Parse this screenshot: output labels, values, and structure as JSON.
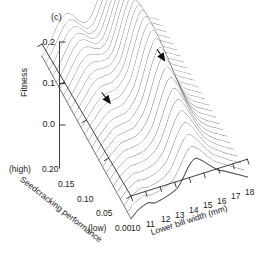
{
  "panel": {
    "label": "(c)"
  },
  "axes": {
    "vertical": {
      "title": "Fitness",
      "ticks": [
        "0.2",
        "0.1",
        "0.0"
      ],
      "values": [
        0.2,
        0.1,
        0.0
      ],
      "range": [
        -0.05,
        0.2
      ]
    },
    "left": {
      "title": "Seedcracking performance",
      "ticks": [
        "0.20",
        "0.15",
        "0.10",
        "0.05",
        "0.00"
      ],
      "values": [
        0.2,
        0.15,
        0.1,
        0.05,
        0.0
      ],
      "high_tag": "(high)",
      "low_tag": "(low)",
      "range": [
        0.0,
        0.2
      ]
    },
    "bottom": {
      "title": "Lower bill width (mm)",
      "ticks": [
        "10",
        "11",
        "12",
        "13",
        "14",
        "15",
        "16",
        "17",
        "18"
      ],
      "values": [
        10,
        11,
        12,
        13,
        14,
        15,
        16,
        17,
        18
      ],
      "range": [
        10,
        18
      ]
    }
  },
  "annotations": [
    {
      "name": "arrow-small-peak",
      "target": "small fitness peak",
      "x": 11.6,
      "y": 0.165,
      "fitness": 0.055
    },
    {
      "name": "arrow-large-peak",
      "target": "large fitness peak",
      "x": 14.3,
      "y": 0.07,
      "fitness": 0.155
    }
  ],
  "colors": {
    "surface": "#3a3a3a",
    "axis": "#2b2b2b",
    "text": "#1a1a1a",
    "background": "#ffffff"
  },
  "chart_data": {
    "type": "line",
    "title": "(c)",
    "subtitle": "Three-dimensional fitness surface: bimodal adaptive landscape",
    "xlabel": "Lower bill width (mm)",
    "ylabel": "Seedcracking performance",
    "zlabel": "Fitness",
    "xlim": [
      10,
      18
    ],
    "ylim": [
      0.0,
      0.2
    ],
    "zlim": [
      -0.05,
      0.2
    ],
    "grid": false,
    "legend": null,
    "projection": "3d-wireframe-profiles",
    "n_profiles": 26,
    "peaks": [
      {
        "label": "small peak",
        "bill_width_mm": 11.6,
        "seedcracking": 0.165,
        "fitness": 0.055
      },
      {
        "label": "large peak",
        "bill_width_mm": 14.3,
        "seedcracking": 0.07,
        "fitness": 0.155
      }
    ],
    "valley": {
      "bill_width_mm": 12.9,
      "seedcracking": 0.12,
      "fitness": 0.01
    },
    "x_samples": [
      10.0,
      10.4,
      10.8,
      11.2,
      11.6,
      12.0,
      12.4,
      12.8,
      13.2,
      13.6,
      14.0,
      14.4,
      14.8,
      15.2,
      15.6,
      16.0,
      16.4,
      16.8,
      17.2,
      17.6,
      18.0
    ],
    "series": [
      {
        "name": "y=0.200",
        "seedcracking": 0.2,
        "values": [
          -0.03,
          -0.012,
          0.014,
          0.04,
          0.054,
          0.05,
          0.034,
          0.02,
          0.022,
          0.044,
          0.078,
          0.1,
          0.094,
          0.072,
          0.046,
          0.024,
          0.008,
          -0.004,
          -0.014,
          -0.022,
          -0.03
        ]
      },
      {
        "name": "y=0.192",
        "seedcracking": 0.192,
        "values": [
          -0.031,
          -0.013,
          0.013,
          0.039,
          0.053,
          0.049,
          0.034,
          0.021,
          0.024,
          0.048,
          0.084,
          0.108,
          0.101,
          0.078,
          0.05,
          0.026,
          0.009,
          -0.004,
          -0.014,
          -0.022,
          -0.03
        ]
      },
      {
        "name": "y=0.184",
        "seedcracking": 0.184,
        "values": [
          -0.032,
          -0.014,
          0.012,
          0.037,
          0.051,
          0.048,
          0.034,
          0.023,
          0.028,
          0.054,
          0.092,
          0.118,
          0.11,
          0.085,
          0.055,
          0.029,
          0.01,
          -0.004,
          -0.014,
          -0.022,
          -0.03
        ]
      },
      {
        "name": "y=0.176",
        "seedcracking": 0.176,
        "values": [
          -0.033,
          -0.015,
          0.01,
          0.035,
          0.049,
          0.047,
          0.035,
          0.026,
          0.033,
          0.062,
          0.102,
          0.13,
          0.12,
          0.093,
          0.06,
          0.032,
          0.011,
          -0.004,
          -0.014,
          -0.022,
          -0.03
        ]
      },
      {
        "name": "y=0.168",
        "seedcracking": 0.168,
        "values": [
          -0.034,
          -0.016,
          0.009,
          0.034,
          0.048,
          0.046,
          0.036,
          0.029,
          0.038,
          0.07,
          0.113,
          0.143,
          0.131,
          0.101,
          0.065,
          0.035,
          0.012,
          -0.004,
          -0.014,
          -0.022,
          -0.03
        ]
      },
      {
        "name": "y=0.160",
        "seedcracking": 0.16,
        "values": [
          -0.035,
          -0.017,
          0.007,
          0.031,
          0.045,
          0.044,
          0.036,
          0.032,
          0.043,
          0.078,
          0.123,
          0.154,
          0.141,
          0.108,
          0.07,
          0.038,
          0.013,
          -0.004,
          -0.014,
          -0.022,
          -0.03
        ]
      },
      {
        "name": "y=0.152",
        "seedcracking": 0.152,
        "values": [
          -0.036,
          -0.018,
          0.005,
          0.028,
          0.041,
          0.041,
          0.036,
          0.035,
          0.048,
          0.086,
          0.132,
          0.163,
          0.149,
          0.114,
          0.074,
          0.04,
          0.014,
          -0.004,
          -0.014,
          -0.022,
          -0.03
        ]
      },
      {
        "name": "y=0.144",
        "seedcracking": 0.144,
        "values": [
          -0.037,
          -0.02,
          0.002,
          0.024,
          0.037,
          0.038,
          0.035,
          0.037,
          0.053,
          0.093,
          0.14,
          0.17,
          0.155,
          0.119,
          0.077,
          0.042,
          0.014,
          -0.004,
          -0.014,
          -0.022,
          -0.03
        ]
      },
      {
        "name": "y=0.136",
        "seedcracking": 0.136,
        "values": [
          -0.038,
          -0.021,
          0.0,
          0.021,
          0.033,
          0.035,
          0.034,
          0.039,
          0.057,
          0.099,
          0.146,
          0.175,
          0.159,
          0.122,
          0.079,
          0.043,
          0.015,
          -0.004,
          -0.014,
          -0.022,
          -0.03
        ]
      },
      {
        "name": "y=0.128",
        "seedcracking": 0.128,
        "values": [
          -0.039,
          -0.022,
          -0.002,
          0.018,
          0.029,
          0.031,
          0.032,
          0.04,
          0.06,
          0.104,
          0.15,
          0.178,
          0.161,
          0.124,
          0.08,
          0.044,
          0.015,
          -0.004,
          -0.014,
          -0.022,
          -0.03
        ]
      },
      {
        "name": "y=0.120",
        "seedcracking": 0.12,
        "values": [
          -0.04,
          -0.023,
          -0.004,
          0.015,
          0.025,
          0.027,
          0.029,
          0.04,
          0.062,
          0.107,
          0.153,
          0.18,
          0.162,
          0.124,
          0.081,
          0.044,
          0.015,
          -0.004,
          -0.014,
          -0.022,
          -0.03
        ]
      },
      {
        "name": "y=0.112",
        "seedcracking": 0.112,
        "values": [
          -0.041,
          -0.024,
          -0.006,
          0.012,
          0.021,
          0.023,
          0.026,
          0.039,
          0.062,
          0.108,
          0.154,
          0.18,
          0.162,
          0.124,
          0.081,
          0.044,
          0.015,
          -0.005,
          -0.015,
          -0.023,
          -0.031
        ]
      },
      {
        "name": "y=0.104",
        "seedcracking": 0.104,
        "values": [
          -0.042,
          -0.025,
          -0.008,
          0.009,
          0.017,
          0.019,
          0.023,
          0.037,
          0.061,
          0.107,
          0.153,
          0.179,
          0.16,
          0.122,
          0.08,
          0.043,
          0.015,
          -0.005,
          -0.015,
          -0.023,
          -0.031
        ]
      },
      {
        "name": "y=0.096",
        "seedcracking": 0.096,
        "values": [
          -0.043,
          -0.026,
          -0.01,
          0.006,
          0.013,
          0.015,
          0.019,
          0.034,
          0.059,
          0.104,
          0.15,
          0.176,
          0.157,
          0.119,
          0.078,
          0.042,
          0.014,
          -0.005,
          -0.015,
          -0.023,
          -0.031
        ]
      },
      {
        "name": "y=0.088",
        "seedcracking": 0.088,
        "values": [
          -0.044,
          -0.027,
          -0.012,
          0.003,
          0.009,
          0.011,
          0.015,
          0.03,
          0.055,
          0.1,
          0.145,
          0.171,
          0.152,
          0.115,
          0.075,
          0.04,
          0.013,
          -0.005,
          -0.015,
          -0.023,
          -0.031
        ]
      },
      {
        "name": "y=0.080",
        "seedcracking": 0.08,
        "values": [
          -0.045,
          -0.029,
          -0.014,
          0.0,
          0.005,
          0.007,
          0.011,
          0.026,
          0.05,
          0.094,
          0.139,
          0.164,
          0.146,
          0.11,
          0.071,
          0.038,
          0.012,
          -0.005,
          -0.015,
          -0.023,
          -0.031
        ]
      },
      {
        "name": "y=0.072",
        "seedcracking": 0.072,
        "values": [
          -0.046,
          -0.03,
          -0.016,
          -0.003,
          0.001,
          0.003,
          0.007,
          0.021,
          0.045,
          0.087,
          0.131,
          0.156,
          0.138,
          0.104,
          0.067,
          0.035,
          0.011,
          -0.005,
          -0.015,
          -0.023,
          -0.031
        ]
      },
      {
        "name": "y=0.064",
        "seedcracking": 0.064,
        "values": [
          -0.047,
          -0.031,
          -0.018,
          -0.006,
          -0.003,
          -0.001,
          0.003,
          0.016,
          0.039,
          0.079,
          0.122,
          0.146,
          0.129,
          0.097,
          0.062,
          0.032,
          0.009,
          -0.006,
          -0.016,
          -0.024,
          -0.032
        ]
      },
      {
        "name": "y=0.056",
        "seedcracking": 0.056,
        "values": [
          -0.048,
          -0.032,
          -0.02,
          -0.009,
          -0.007,
          -0.005,
          -0.001,
          0.011,
          0.032,
          0.071,
          0.112,
          0.135,
          0.119,
          0.089,
          0.057,
          0.029,
          0.008,
          -0.006,
          -0.016,
          -0.024,
          -0.032
        ]
      },
      {
        "name": "y=0.048",
        "seedcracking": 0.048,
        "values": [
          -0.049,
          -0.034,
          -0.022,
          -0.012,
          -0.011,
          -0.009,
          -0.005,
          0.006,
          0.026,
          0.062,
          0.101,
          0.123,
          0.108,
          0.081,
          0.051,
          0.025,
          0.006,
          -0.007,
          -0.017,
          -0.025,
          -0.033
        ]
      },
      {
        "name": "y=0.040",
        "seedcracking": 0.04,
        "values": [
          -0.05,
          -0.035,
          -0.024,
          -0.015,
          -0.015,
          -0.013,
          -0.009,
          0.001,
          0.019,
          0.053,
          0.09,
          0.111,
          0.097,
          0.072,
          0.045,
          0.021,
          0.004,
          -0.008,
          -0.018,
          -0.026,
          -0.034
        ]
      },
      {
        "name": "y=0.032",
        "seedcracking": 0.032,
        "values": [
          -0.051,
          -0.036,
          -0.026,
          -0.018,
          -0.019,
          -0.017,
          -0.013,
          -0.004,
          0.012,
          0.044,
          0.078,
          0.098,
          0.085,
          0.063,
          0.038,
          0.017,
          0.002,
          -0.009,
          -0.019,
          -0.027,
          -0.035
        ]
      },
      {
        "name": "y=0.024",
        "seedcracking": 0.024,
        "values": [
          -0.052,
          -0.038,
          -0.028,
          -0.021,
          -0.023,
          -0.021,
          -0.017,
          -0.009,
          0.005,
          0.035,
          0.066,
          0.084,
          0.073,
          0.053,
          0.031,
          0.012,
          -0.001,
          -0.011,
          -0.021,
          -0.029,
          -0.037
        ]
      },
      {
        "name": "y=0.016",
        "seedcracking": 0.016,
        "values": [
          -0.053,
          -0.039,
          -0.03,
          -0.024,
          -0.027,
          -0.025,
          -0.021,
          -0.014,
          -0.002,
          0.025,
          0.054,
          0.07,
          0.06,
          0.043,
          0.024,
          0.007,
          -0.004,
          -0.013,
          -0.023,
          -0.031,
          -0.039
        ]
      },
      {
        "name": "y=0.008",
        "seedcracking": 0.008,
        "values": [
          -0.054,
          -0.04,
          -0.032,
          -0.027,
          -0.031,
          -0.029,
          -0.025,
          -0.019,
          -0.009,
          0.015,
          0.042,
          0.056,
          0.047,
          0.032,
          0.016,
          0.002,
          -0.007,
          -0.016,
          -0.025,
          -0.033,
          -0.041
        ]
      },
      {
        "name": "y=0.000",
        "seedcracking": 0.0,
        "values": [
          -0.055,
          -0.042,
          -0.034,
          -0.03,
          -0.035,
          -0.033,
          -0.029,
          -0.024,
          -0.016,
          0.005,
          0.03,
          0.042,
          0.034,
          0.021,
          0.008,
          -0.004,
          -0.011,
          -0.019,
          -0.027,
          -0.035,
          -0.043
        ]
      }
    ]
  }
}
